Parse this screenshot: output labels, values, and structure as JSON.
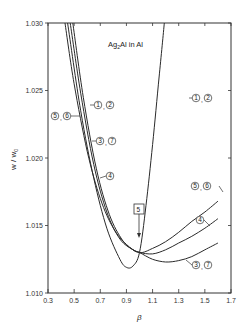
{
  "chart_data": {
    "type": "line",
    "title": "Ag2Al in Al",
    "xlabel": "β",
    "ylabel": "w / w0",
    "xlim": [
      0.3,
      1.7
    ],
    "ylim": [
      1.01,
      1.03
    ],
    "x_ticks": [
      "0.3",
      "0.5",
      "0.7",
      "0.9",
      "1.1",
      "1.3",
      "1.5",
      "1.7"
    ],
    "y_ticks": [
      "1.010",
      "1.015",
      "1.020",
      "1.025",
      "1.030"
    ],
    "grid": false,
    "legend": "inline circled curve labels",
    "annotations": [
      {
        "text": "5",
        "style": "boxed",
        "points_to": [
          1.0,
          1.013
        ]
      }
    ],
    "series": [
      {
        "name": "1, 2",
        "x": [
          0.45,
          0.55,
          0.65,
          0.75,
          0.85,
          0.9,
          0.95,
          1.0,
          1.05,
          1.1,
          1.15,
          1.19
        ],
        "y": [
          1.03,
          1.0235,
          1.0185,
          1.0148,
          1.0125,
          1.0119,
          1.012,
          1.013,
          1.0165,
          1.021,
          1.026,
          1.03
        ]
      },
      {
        "name": "5, 6",
        "x": [
          0.43,
          0.5,
          0.6,
          0.7,
          0.8,
          0.9,
          1.0,
          1.1,
          1.2,
          1.3,
          1.4,
          1.5,
          1.6
        ],
        "y": [
          1.03,
          1.0255,
          1.0205,
          1.017,
          1.0148,
          1.0136,
          1.013,
          1.0133,
          1.0138,
          1.0145,
          1.0153,
          1.016,
          1.0168
        ]
      },
      {
        "name": "4",
        "x": [
          0.47,
          0.55,
          0.65,
          0.75,
          0.85,
          0.95,
          1.0,
          1.1,
          1.2,
          1.3,
          1.4,
          1.5,
          1.6
        ],
        "y": [
          1.03,
          1.0248,
          1.0195,
          1.016,
          1.014,
          1.0132,
          1.013,
          1.0129,
          1.0132,
          1.0137,
          1.0142,
          1.0148,
          1.0155
        ]
      },
      {
        "name": "3, 7",
        "x": [
          0.49,
          0.57,
          0.67,
          0.77,
          0.87,
          0.95,
          1.0,
          1.1,
          1.2,
          1.3,
          1.4,
          1.5,
          1.6
        ],
        "y": [
          1.03,
          1.0245,
          1.0192,
          1.0158,
          1.0139,
          1.0132,
          1.013,
          1.0125,
          1.0123,
          1.0124,
          1.0127,
          1.0132,
          1.0137
        ]
      }
    ],
    "curve_labels": [
      {
        "text": "1, 2",
        "position": "upper right, on rising branch"
      },
      {
        "text": "1, 2",
        "position": "upper left, on descending branch"
      },
      {
        "text": "5, 6",
        "position": "left, on descending branch"
      },
      {
        "text": "3, 7",
        "position": "left, on descending branch"
      },
      {
        "text": "4",
        "position": "left, on descending branch"
      },
      {
        "text": "5, 6",
        "position": "right end"
      },
      {
        "text": "4",
        "position": "right end"
      },
      {
        "text": "3, 7",
        "position": "right end"
      }
    ]
  },
  "labels": {
    "title_main": "Ag",
    "title_sub": "2",
    "title_rest": "Al in Al",
    "xlabel": "β",
    "ylabel": "w / w",
    "ylabel_sub": "0",
    "box5": "5"
  }
}
